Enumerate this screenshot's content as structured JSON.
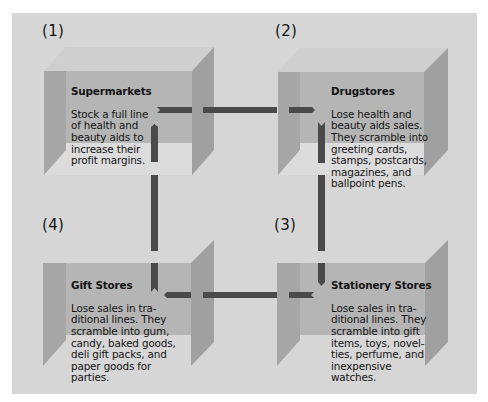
{
  "diagram": {
    "type": "scrambled-merchandising-cycle",
    "colors": {
      "background": "#d6d6d6",
      "box_top": "#cfcfcf",
      "box_back": "#b5b5b5",
      "box_floor": "#dcdcdc",
      "box_wall_left": "#a6a6a6",
      "box_wall_right": "#a0a0a0",
      "arrow": "#4a4a4a",
      "text": "#141414"
    },
    "stages": [
      {
        "number": "(1)",
        "title": "Supermarkets",
        "body": "Stock a full line\nof health and\nbeauty aids to\nincrease their\nprofit margins."
      },
      {
        "number": "(2)",
        "title": "Drugstores",
        "body": "Lose health and\nbeauty aids sales.\nThey scramble into\ngreeting cards,\nstamps, postcards,\nmagazines, and\nballpoint pens."
      },
      {
        "number": "(3)",
        "title": "Stationery Stores",
        "body": "Lose sales in tra-\nditional lines. They\nscramble into gift\nitems, toys, novel-\nties, perfume, and\ninexpensive\nwatches."
      },
      {
        "number": "(4)",
        "title": "Gift Stores",
        "body": "Lose sales in tra-\nditional lines. They\nscramble into gum,\ncandy, baked goods,\ndeli gift packs, and\npaper goods for\nparties."
      }
    ],
    "flows": [
      {
        "from": "(1)",
        "to": "(2)",
        "direction": "right"
      },
      {
        "from": "(2)",
        "to": "(3)",
        "direction": "down"
      },
      {
        "from": "(3)",
        "to": "(4)",
        "direction": "left"
      },
      {
        "from": "(4)",
        "to": "(1)",
        "direction": "up"
      }
    ]
  }
}
